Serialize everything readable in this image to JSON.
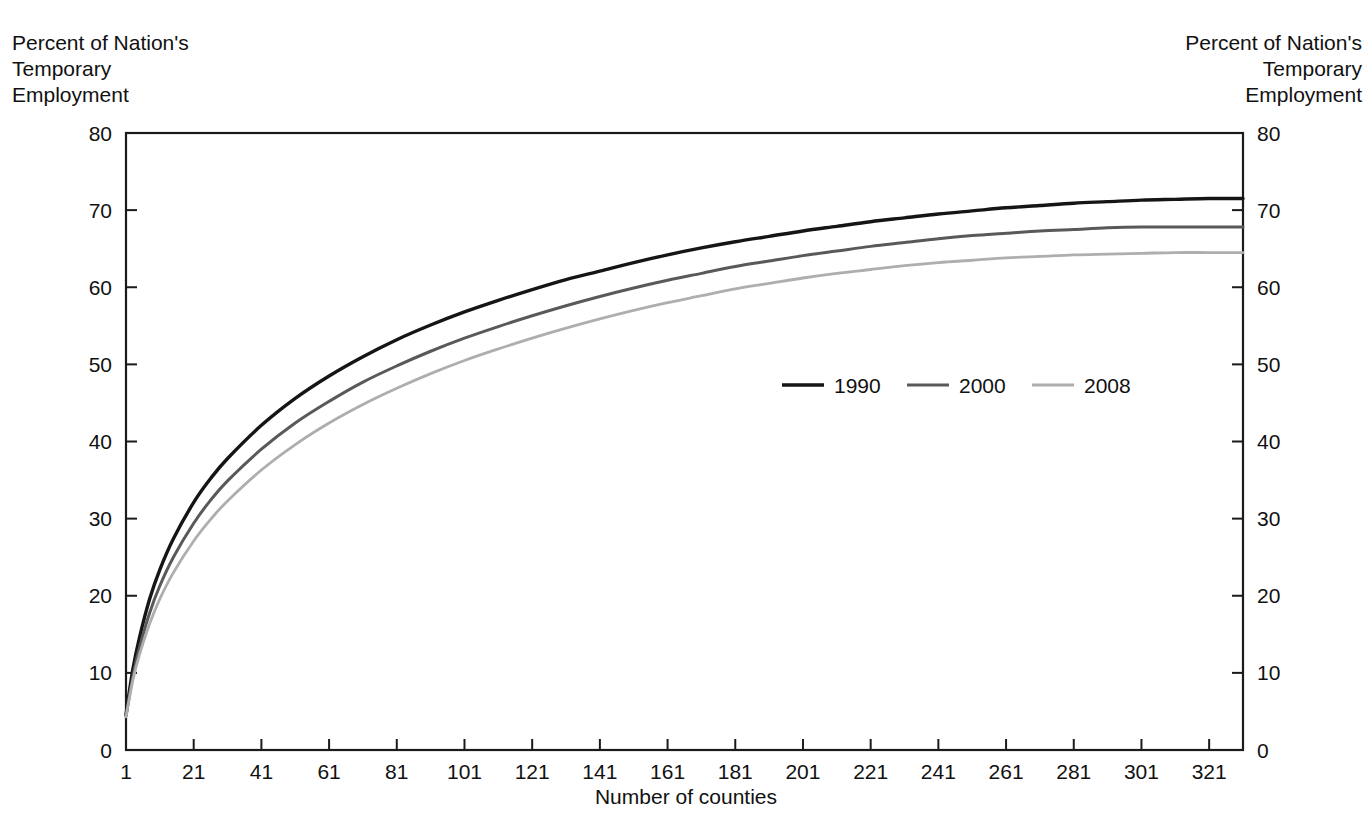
{
  "chart_data": {
    "type": "line",
    "title": "",
    "subtitle": "",
    "xlabel": "Number of counties",
    "ylabel": "Percent of Nation's\nTemporary\nEmployment",
    "ylabel_right": "Percent of Nation's\nTemporary\nEmployment",
    "xlim": [
      1,
      331
    ],
    "ylim": [
      0,
      80
    ],
    "grid": false,
    "legend_position": "center-right-inside",
    "x_ticks": [
      1,
      21,
      41,
      61,
      81,
      101,
      121,
      141,
      161,
      181,
      201,
      221,
      241,
      261,
      281,
      301,
      321
    ],
    "y_ticks": [
      0,
      10,
      20,
      30,
      40,
      50,
      60,
      70,
      80
    ],
    "x": [
      1,
      3,
      5,
      8,
      11,
      15,
      21,
      26,
      31,
      41,
      51,
      61,
      71,
      81,
      91,
      101,
      111,
      121,
      131,
      141,
      151,
      161,
      171,
      181,
      191,
      201,
      211,
      221,
      231,
      241,
      251,
      261,
      271,
      281,
      291,
      301,
      311,
      321,
      331
    ],
    "series": [
      {
        "name": "1990",
        "color": "#151515",
        "values": [
          4.6,
          10.4,
          14.6,
          19.6,
          23.4,
          27.4,
          32.1,
          35.2,
          37.8,
          42.1,
          45.6,
          48.5,
          51.0,
          53.2,
          55.1,
          56.8,
          58.3,
          59.7,
          61.0,
          62.1,
          63.2,
          64.2,
          65.1,
          65.9,
          66.6,
          67.3,
          67.9,
          68.5,
          69.0,
          69.5,
          69.9,
          70.3,
          70.6,
          70.9,
          71.1,
          71.3,
          71.4,
          71.5,
          71.5
        ]
      },
      {
        "name": "2000",
        "color": "#595959",
        "values": [
          4.4,
          9.5,
          13.3,
          17.8,
          21.3,
          25.0,
          29.4,
          32.4,
          34.9,
          39.0,
          42.4,
          45.2,
          47.7,
          49.8,
          51.7,
          53.4,
          54.9,
          56.3,
          57.6,
          58.8,
          59.9,
          60.9,
          61.8,
          62.7,
          63.4,
          64.1,
          64.7,
          65.3,
          65.8,
          66.3,
          66.7,
          67.0,
          67.3,
          67.5,
          67.7,
          67.8,
          67.8,
          67.8,
          67.8
        ]
      },
      {
        "name": "2008",
        "color": "#aeaeae",
        "values": [
          4.3,
          9.0,
          12.4,
          16.4,
          19.6,
          23.0,
          27.1,
          29.9,
          32.3,
          36.3,
          39.6,
          42.4,
          44.8,
          46.9,
          48.8,
          50.5,
          52.0,
          53.4,
          54.7,
          55.9,
          57.0,
          58.0,
          58.9,
          59.8,
          60.5,
          61.2,
          61.8,
          62.3,
          62.8,
          63.2,
          63.5,
          63.8,
          64.0,
          64.2,
          64.3,
          64.4,
          64.5,
          64.5,
          64.5
        ]
      }
    ]
  },
  "legend": {
    "items": [
      {
        "label": "1990",
        "color": "#151515"
      },
      {
        "label": "2000",
        "color": "#595959"
      },
      {
        "label": "2008",
        "color": "#aeaeae"
      }
    ]
  }
}
